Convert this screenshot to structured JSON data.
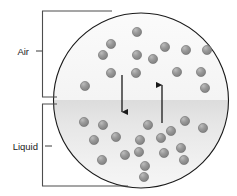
{
  "diagram": {
    "labels": {
      "air": "Air",
      "liquid": "Liquid"
    },
    "colors": {
      "circle_stroke": "#1a1a1a",
      "air_fill": "#fafafa",
      "liquid_fill_top": "#e0e0e0",
      "liquid_fill_bottom": "#f0f0f0",
      "molecule_fill": "#8c8c8c",
      "molecule_highlight": "#b8b8b8",
      "molecule_stroke": "#6e6e6e",
      "bracket_stroke": "#4d4d4d",
      "arrow_stroke": "#1a1a1a",
      "text": "#1a1a1a"
    },
    "circle": {
      "cx": 141,
      "cy": 100.5,
      "r": 87.5
    },
    "liquid_surface_y": 100,
    "arrows": [
      {
        "name": "condensation-arrow",
        "direction": "down",
        "x": 122,
        "y1": 75,
        "y2": 118
      },
      {
        "name": "evaporation-arrow",
        "direction": "up",
        "x": 162,
        "y1": 123,
        "y2": 79
      }
    ],
    "bracket_air": {
      "x": 42,
      "top": 11,
      "bottom": 97,
      "tick_x_end": 57,
      "label_x": 29,
      "label_y": 51
    },
    "bracket_liquid": {
      "x": 42,
      "top": 104,
      "bottom": 186,
      "tick_x_end": 57,
      "label_x": 38,
      "label_y": 146
    },
    "molecule_radius": 4.6,
    "molecules_air": [
      {
        "cx": 137,
        "cy": 32
      },
      {
        "cx": 111,
        "cy": 44
      },
      {
        "cx": 165,
        "cy": 47
      },
      {
        "cx": 186,
        "cy": 50
      },
      {
        "cx": 207,
        "cy": 50
      },
      {
        "cx": 103,
        "cy": 55
      },
      {
        "cx": 137,
        "cy": 55
      },
      {
        "cx": 153,
        "cy": 59
      },
      {
        "cx": 111,
        "cy": 73
      },
      {
        "cx": 136,
        "cy": 73
      },
      {
        "cx": 177,
        "cy": 72
      },
      {
        "cx": 201,
        "cy": 72
      },
      {
        "cx": 85,
        "cy": 86
      },
      {
        "cx": 205,
        "cy": 88
      }
    ],
    "molecules_liquid": [
      {
        "cx": 84,
        "cy": 122
      },
      {
        "cx": 103,
        "cy": 125
      },
      {
        "cx": 148,
        "cy": 125
      },
      {
        "cx": 185,
        "cy": 121
      },
      {
        "cx": 171,
        "cy": 131
      },
      {
        "cx": 203,
        "cy": 128
      },
      {
        "cx": 94,
        "cy": 140
      },
      {
        "cx": 116,
        "cy": 137
      },
      {
        "cx": 140,
        "cy": 140
      },
      {
        "cx": 161,
        "cy": 138
      },
      {
        "cx": 181,
        "cy": 148
      },
      {
        "cx": 125,
        "cy": 155
      },
      {
        "cx": 164,
        "cy": 153
      },
      {
        "cx": 139,
        "cy": 152
      },
      {
        "cx": 102,
        "cy": 160
      },
      {
        "cx": 145,
        "cy": 166
      },
      {
        "cx": 184,
        "cy": 160
      },
      {
        "cx": 144,
        "cy": 177
      }
    ]
  }
}
